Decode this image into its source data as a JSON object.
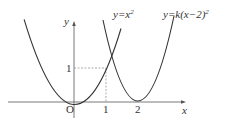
{
  "diagram": {
    "type": "function-graph",
    "axes": {
      "x_label": "x",
      "y_label": "y",
      "origin_label": "O",
      "x_ticks": [
        "1",
        "2"
      ],
      "y_ticks": [
        "1"
      ]
    },
    "curves": [
      {
        "name": "parabola-1",
        "label_prefix": "y=x",
        "label_sup": "2",
        "equation": "y=x^2",
        "vertex": [
          0,
          0
        ]
      },
      {
        "name": "parabola-2",
        "label_prefix": "y=k(x−2)",
        "label_sup": "2",
        "equation": "y=k(x-2)^2",
        "vertex": [
          2,
          0
        ]
      }
    ],
    "guides": {
      "point": [
        1,
        1
      ],
      "style": "dashed"
    },
    "colors": {
      "curve": "#333333",
      "axis": "#555555",
      "guide": "#888888"
    }
  }
}
